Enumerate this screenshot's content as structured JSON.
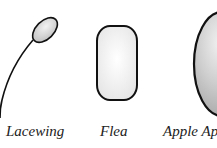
{
  "figure": {
    "eggs": [
      {
        "name": "Lacewing",
        "shape": "stalked-oval",
        "fill": "#d8d8d8"
      },
      {
        "name": "Flea",
        "shape": "rounded-rectangle",
        "fill": "#f4f4f4"
      },
      {
        "name": "Apple Aphid",
        "shape": "elongated-oval",
        "fill": "#c8c8c8"
      }
    ],
    "labels": {
      "lacewing": "Lacewing",
      "flea": "Flea",
      "apple": "Apple Ap"
    },
    "colors": {
      "outline": "#111111",
      "background": "#ffffff"
    }
  }
}
